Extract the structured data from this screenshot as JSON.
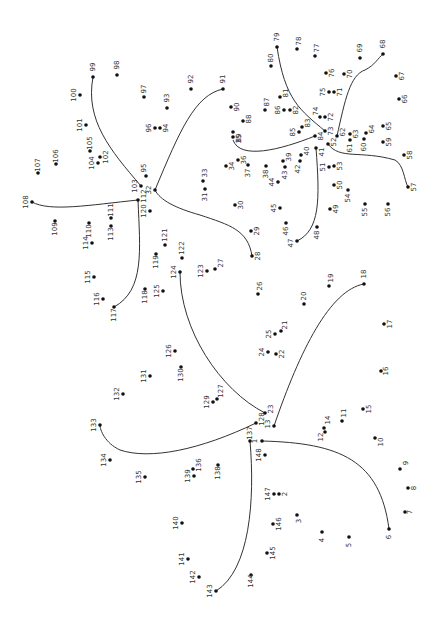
{
  "puzzle": {
    "title": "Dot-to-dot puzzle",
    "label_rotation_deg": -90,
    "dot_color": "#111111",
    "line_color": "#333333",
    "dots": [
      {
        "n": "1",
        "x": 262,
        "y": 441,
        "lx": -7,
        "ly": 0
      },
      {
        "n": "2",
        "x": 279,
        "y": 494,
        "lx": 6,
        "ly": 0
      },
      {
        "n": "3",
        "x": 297,
        "y": 515,
        "lx": 2,
        "ly": 6
      },
      {
        "n": "4",
        "x": 322,
        "y": 532,
        "lx": 0,
        "ly": 8
      },
      {
        "n": "5",
        "x": 349,
        "y": 537,
        "lx": 0,
        "ly": 8
      },
      {
        "n": "6",
        "x": 389,
        "y": 529,
        "lx": 0,
        "ly": 8
      },
      {
        "n": "7",
        "x": 405,
        "y": 512,
        "lx": 5,
        "ly": 0
      },
      {
        "n": "8",
        "x": 408,
        "y": 488,
        "lx": 6,
        "ly": 0
      },
      {
        "n": "9",
        "x": 400,
        "y": 469,
        "lx": 6,
        "ly": -6
      },
      {
        "n": "10",
        "x": 375,
        "y": 438,
        "lx": 6,
        "ly": 4
      },
      {
        "n": "11",
        "x": 342,
        "y": 421,
        "lx": 2,
        "ly": -8
      },
      {
        "n": "12",
        "x": 325,
        "y": 432,
        "lx": -4,
        "ly": 5
      },
      {
        "n": "13",
        "x": 274,
        "y": 426,
        "lx": -6,
        "ly": -2
      },
      {
        "n": "14",
        "x": 324,
        "y": 428,
        "lx": 4,
        "ly": -8
      },
      {
        "n": "15",
        "x": 363,
        "y": 409,
        "lx": 6,
        "ly": 0
      },
      {
        "n": "16",
        "x": 381,
        "y": 371,
        "lx": 5,
        "ly": 0
      },
      {
        "n": "17",
        "x": 384,
        "y": 324,
        "lx": 6,
        "ly": 0
      },
      {
        "n": "18",
        "x": 364,
        "y": 284,
        "lx": 0,
        "ly": -10
      },
      {
        "n": "19",
        "x": 329,
        "y": 286,
        "lx": 2,
        "ly": -8
      },
      {
        "n": "20",
        "x": 304,
        "y": 304,
        "lx": 0,
        "ly": -8
      },
      {
        "n": "21",
        "x": 281,
        "y": 331,
        "lx": 4,
        "ly": -6
      },
      {
        "n": "22",
        "x": 276,
        "y": 354,
        "lx": 6,
        "ly": 0
      },
      {
        "n": "23",
        "x": 265,
        "y": 413,
        "lx": 6,
        "ly": -4
      },
      {
        "n": "24",
        "x": 268,
        "y": 352,
        "lx": -6,
        "ly": 0
      },
      {
        "n": "25",
        "x": 275,
        "y": 334,
        "lx": -6,
        "ly": 0
      },
      {
        "n": "26",
        "x": 258,
        "y": 294,
        "lx": 2,
        "ly": -8
      },
      {
        "n": "27",
        "x": 215,
        "y": 269,
        "lx": 6,
        "ly": -6
      },
      {
        "n": "28",
        "x": 252,
        "y": 256,
        "lx": 6,
        "ly": 0
      },
      {
        "n": "29",
        "x": 251,
        "y": 231,
        "lx": 6,
        "ly": 0
      },
      {
        "n": "30",
        "x": 235,
        "y": 205,
        "lx": 6,
        "ly": 0
      },
      {
        "n": "31",
        "x": 205,
        "y": 189,
        "lx": 0,
        "ly": 8
      },
      {
        "n": "32",
        "x": 155,
        "y": 190,
        "lx": -6,
        "ly": 0
      },
      {
        "n": "33",
        "x": 203,
        "y": 181,
        "lx": 2,
        "ly": -8
      },
      {
        "n": "34",
        "x": 226,
        "y": 166,
        "lx": 6,
        "ly": 0
      },
      {
        "n": "35",
        "x": 233,
        "y": 137,
        "lx": 6,
        "ly": 2
      },
      {
        "n": "36",
        "x": 238,
        "y": 160,
        "lx": 6,
        "ly": 0
      },
      {
        "n": "37",
        "x": 248,
        "y": 165,
        "lx": 0,
        "ly": 8
      },
      {
        "n": "38",
        "x": 266,
        "y": 166,
        "lx": 0,
        "ly": 8
      },
      {
        "n": "39",
        "x": 283,
        "y": 161,
        "lx": 6,
        "ly": -4
      },
      {
        "n": "40",
        "x": 301,
        "y": 155,
        "lx": 6,
        "ly": -4
      },
      {
        "n": "41",
        "x": 316,
        "y": 148,
        "lx": 6,
        "ly": 4
      },
      {
        "n": "42",
        "x": 300,
        "y": 161,
        "lx": -2,
        "ly": 8
      },
      {
        "n": "43",
        "x": 285,
        "y": 167,
        "lx": 0,
        "ly": 8
      },
      {
        "n": "44",
        "x": 278,
        "y": 182,
        "lx": -6,
        "ly": 0
      },
      {
        "n": "45",
        "x": 280,
        "y": 208,
        "lx": -6,
        "ly": 0
      },
      {
        "n": "46",
        "x": 286,
        "y": 223,
        "lx": 0,
        "ly": 8
      },
      {
        "n": "47",
        "x": 297,
        "y": 241,
        "lx": -6,
        "ly": 2
      },
      {
        "n": "48",
        "x": 317,
        "y": 227,
        "lx": 0,
        "ly": 8
      },
      {
        "n": "49",
        "x": 330,
        "y": 209,
        "lx": 6,
        "ly": 0
      },
      {
        "n": "50",
        "x": 334,
        "y": 185,
        "lx": 6,
        "ly": 0
      },
      {
        "n": "51",
        "x": 329,
        "y": 167,
        "lx": -6,
        "ly": 0
      },
      {
        "n": "52",
        "x": 328,
        "y": 144,
        "lx": 6,
        "ly": -2
      },
      {
        "n": "53",
        "x": 334,
        "y": 166,
        "lx": 6,
        "ly": 0
      },
      {
        "n": "54",
        "x": 348,
        "y": 190,
        "lx": 0,
        "ly": 8
      },
      {
        "n": "55",
        "x": 365,
        "y": 204,
        "lx": 0,
        "ly": 8
      },
      {
        "n": "56",
        "x": 388,
        "y": 204,
        "lx": 0,
        "ly": 8
      },
      {
        "n": "57",
        "x": 408,
        "y": 187,
        "lx": 6,
        "ly": 0
      },
      {
        "n": "58",
        "x": 404,
        "y": 155,
        "lx": 6,
        "ly": 0
      },
      {
        "n": "59",
        "x": 383,
        "y": 142,
        "lx": 6,
        "ly": 0
      },
      {
        "n": "60",
        "x": 364,
        "y": 139,
        "lx": 0,
        "ly": 8
      },
      {
        "n": "61",
        "x": 350,
        "y": 140,
        "lx": 0,
        "ly": 8
      },
      {
        "n": "62",
        "x": 337,
        "y": 136,
        "lx": 6,
        "ly": -4
      },
      {
        "n": "63",
        "x": 350,
        "y": 134,
        "lx": 6,
        "ly": 0
      },
      {
        "n": "64",
        "x": 366,
        "y": 133,
        "lx": 6,
        "ly": -4
      },
      {
        "n": "65",
        "x": 383,
        "y": 126,
        "lx": 6,
        "ly": 0
      },
      {
        "n": "66",
        "x": 399,
        "y": 99,
        "lx": 6,
        "ly": 0
      },
      {
        "n": "67",
        "x": 396,
        "y": 76,
        "lx": 6,
        "ly": 0
      },
      {
        "n": "68",
        "x": 383,
        "y": 54,
        "lx": 0,
        "ly": -10
      },
      {
        "n": "69",
        "x": 360,
        "y": 58,
        "lx": 0,
        "ly": -10
      },
      {
        "n": "70",
        "x": 344,
        "y": 74,
        "lx": 6,
        "ly": 0
      },
      {
        "n": "71",
        "x": 334,
        "y": 92,
        "lx": 6,
        "ly": 0
      },
      {
        "n": "72",
        "x": 325,
        "y": 117,
        "lx": 6,
        "ly": 0
      },
      {
        "n": "73",
        "x": 325,
        "y": 131,
        "lx": 6,
        "ly": 0
      },
      {
        "n": "74",
        "x": 320,
        "y": 117,
        "lx": -4,
        "ly": -6
      },
      {
        "n": "75",
        "x": 329,
        "y": 92,
        "lx": -6,
        "ly": 0
      },
      {
        "n": "76",
        "x": 326,
        "y": 73,
        "lx": 6,
        "ly": 0
      },
      {
        "n": "77",
        "x": 315,
        "y": 56,
        "lx": 2,
        "ly": -8
      },
      {
        "n": "78",
        "x": 297,
        "y": 49,
        "lx": 2,
        "ly": -8
      },
      {
        "n": "79",
        "x": 277,
        "y": 47,
        "lx": 0,
        "ly": -10
      },
      {
        "n": "80",
        "x": 271,
        "y": 66,
        "lx": 0,
        "ly": -8
      },
      {
        "n": "81",
        "x": 280,
        "y": 97,
        "lx": 6,
        "ly": -4
      },
      {
        "n": "82",
        "x": 290,
        "y": 110,
        "lx": 6,
        "ly": 0
      },
      {
        "n": "83",
        "x": 302,
        "y": 127,
        "lx": 6,
        "ly": -4
      },
      {
        "n": "84",
        "x": 315,
        "y": 136,
        "lx": 6,
        "ly": 0
      },
      {
        "n": "85",
        "x": 299,
        "y": 132,
        "lx": -6,
        "ly": 0
      },
      {
        "n": "86",
        "x": 284,
        "y": 110,
        "lx": -6,
        "ly": 0
      },
      {
        "n": "87",
        "x": 265,
        "y": 110,
        "lx": 2,
        "ly": -8
      },
      {
        "n": "88",
        "x": 243,
        "y": 121,
        "lx": 6,
        "ly": -2
      },
      {
        "n": "89",
        "x": 233,
        "y": 132,
        "lx": 6,
        "ly": 6
      },
      {
        "n": "90",
        "x": 231,
        "y": 107,
        "lx": 6,
        "ly": 0
      },
      {
        "n": "91",
        "x": 223,
        "y": 89,
        "lx": 0,
        "ly": -10
      },
      {
        "n": "92",
        "x": 191,
        "y": 89,
        "lx": 0,
        "ly": -10
      },
      {
        "n": "93",
        "x": 167,
        "y": 108,
        "lx": 0,
        "ly": -10
      },
      {
        "n": "94",
        "x": 160,
        "y": 128,
        "lx": 6,
        "ly": 0
      },
      {
        "n": "95",
        "x": 146,
        "y": 176,
        "lx": -2,
        "ly": -8
      },
      {
        "n": "96",
        "x": 155,
        "y": 128,
        "lx": -6,
        "ly": 0
      },
      {
        "n": "97",
        "x": 144,
        "y": 97,
        "lx": 0,
        "ly": -8
      },
      {
        "n": "98",
        "x": 117,
        "y": 75,
        "lx": 0,
        "ly": -10
      },
      {
        "n": "99",
        "x": 93,
        "y": 77,
        "lx": 0,
        "ly": -10
      },
      {
        "n": "100",
        "x": 80,
        "y": 95,
        "lx": -6,
        "ly": 0
      },
      {
        "n": "101",
        "x": 86,
        "y": 125,
        "lx": -6,
        "ly": 0
      },
      {
        "n": "102",
        "x": 100,
        "y": 157,
        "lx": 6,
        "ly": 0
      },
      {
        "n": "103",
        "x": 141,
        "y": 186,
        "lx": -6,
        "ly": 0
      },
      {
        "n": "104",
        "x": 98,
        "y": 163,
        "lx": -6,
        "ly": 0
      },
      {
        "n": "105",
        "x": 90,
        "y": 151,
        "lx": 0,
        "ly": -8
      },
      {
        "n": "106",
        "x": 56,
        "y": 164,
        "lx": 0,
        "ly": -8
      },
      {
        "n": "107",
        "x": 38,
        "y": 173,
        "lx": 0,
        "ly": -8
      },
      {
        "n": "108",
        "x": 32,
        "y": 202,
        "lx": -6,
        "ly": 0
      },
      {
        "n": "109",
        "x": 55,
        "y": 221,
        "lx": 0,
        "ly": 8
      },
      {
        "n": "110",
        "x": 89,
        "y": 223,
        "lx": 0,
        "ly": 8
      },
      {
        "n": "111",
        "x": 111,
        "y": 218,
        "lx": 0,
        "ly": -8
      },
      {
        "n": "112",
        "x": 138,
        "y": 200,
        "lx": 6,
        "ly": -4
      },
      {
        "n": "113",
        "x": 111,
        "y": 226,
        "lx": 0,
        "ly": 8
      },
      {
        "n": "114",
        "x": 92,
        "y": 243,
        "lx": -6,
        "ly": 0
      },
      {
        "n": "115",
        "x": 94,
        "y": 277,
        "lx": -6,
        "ly": 0
      },
      {
        "n": "116",
        "x": 103,
        "y": 299,
        "lx": -6,
        "ly": 0
      },
      {
        "n": "117",
        "x": 114,
        "y": 307,
        "lx": 0,
        "ly": 8
      },
      {
        "n": "118",
        "x": 145,
        "y": 289,
        "lx": 0,
        "ly": 8
      },
      {
        "n": "119",
        "x": 156,
        "y": 254,
        "lx": 0,
        "ly": 8
      },
      {
        "n": "120",
        "x": 150,
        "y": 211,
        "lx": -6,
        "ly": 0
      },
      {
        "n": "121",
        "x": 165,
        "y": 245,
        "lx": 0,
        "ly": -10
      },
      {
        "n": "122",
        "x": 182,
        "y": 258,
        "lx": 0,
        "ly": -10
      },
      {
        "n": "123",
        "x": 207,
        "y": 271,
        "lx": -6,
        "ly": 0
      },
      {
        "n": "124",
        "x": 180,
        "y": 272,
        "lx": -6,
        "ly": 0
      },
      {
        "n": "125",
        "x": 163,
        "y": 291,
        "lx": -6,
        "ly": 0
      },
      {
        "n": "126",
        "x": 175,
        "y": 351,
        "lx": -6,
        "ly": 0
      },
      {
        "n": "127",
        "x": 217,
        "y": 399,
        "lx": 4,
        "ly": -8
      },
      {
        "n": "128",
        "x": 256,
        "y": 423,
        "lx": 6,
        "ly": -4
      },
      {
        "n": "129",
        "x": 213,
        "y": 402,
        "lx": -6,
        "ly": 0
      },
      {
        "n": "130",
        "x": 181,
        "y": 367,
        "lx": 0,
        "ly": 8
      },
      {
        "n": "131",
        "x": 150,
        "y": 376,
        "lx": -6,
        "ly": 0
      },
      {
        "n": "132",
        "x": 123,
        "y": 394,
        "lx": -6,
        "ly": 0
      },
      {
        "n": "133",
        "x": 100,
        "y": 425,
        "lx": -6,
        "ly": 0
      },
      {
        "n": "134",
        "x": 110,
        "y": 460,
        "lx": -6,
        "ly": 0
      },
      {
        "n": "135",
        "x": 145,
        "y": 477,
        "lx": -6,
        "ly": 0
      },
      {
        "n": "136",
        "x": 193,
        "y": 469,
        "lx": 6,
        "ly": -4
      },
      {
        "n": "137",
        "x": 250,
        "y": 441,
        "lx": 0,
        "ly": -8
      },
      {
        "n": "138",
        "x": 218,
        "y": 465,
        "lx": 0,
        "ly": 8
      },
      {
        "n": "139",
        "x": 194,
        "y": 476,
        "lx": -6,
        "ly": 0
      },
      {
        "n": "140",
        "x": 182,
        "y": 523,
        "lx": -6,
        "ly": 0
      },
      {
        "n": "141",
        "x": 188,
        "y": 559,
        "lx": -6,
        "ly": 0
      },
      {
        "n": "142",
        "x": 199,
        "y": 577,
        "lx": -6,
        "ly": 0
      },
      {
        "n": "143",
        "x": 216,
        "y": 591,
        "lx": -6,
        "ly": 0
      },
      {
        "n": "144",
        "x": 251,
        "y": 575,
        "lx": 0,
        "ly": 6
      },
      {
        "n": "145",
        "x": 267,
        "y": 553,
        "lx": 6,
        "ly": 0
      },
      {
        "n": "146",
        "x": 273,
        "y": 524,
        "lx": 6,
        "ly": 0
      },
      {
        "n": "147",
        "x": 274,
        "y": 494,
        "lx": -6,
        "ly": 0
      },
      {
        "n": "148",
        "x": 265,
        "y": 455,
        "lx": -6,
        "ly": 0
      }
    ],
    "curves": [
      {
        "id": "curve-1-6",
        "d": "M262 441 C 340 443, 380 460, 389 529"
      },
      {
        "id": "curve-13-18",
        "d": "M274 426 C 300 350, 330 290, 364 284"
      },
      {
        "id": "curve-23-124",
        "d": "M265 413 C 220 390, 180 330, 180 272"
      },
      {
        "id": "curve-28-32",
        "d": "M252 256 C 248 230, 230 225, 200 215 C 175 208, 160 200, 155 190"
      },
      {
        "id": "curve-32-91",
        "d": "M155 190 C 180 130, 195 95, 223 89"
      },
      {
        "id": "curve-89-84",
        "d": "M233 140 C 240 160, 280 150, 315 136"
      },
      {
        "id": "curve-41-47",
        "d": "M316 148 C 320 200, 320 230, 297 241"
      },
      {
        "id": "curve-52-57",
        "d": "M328 144 C 340 160, 360 150, 395 160 C 404 165, 404 180, 408 187"
      },
      {
        "id": "curve-62-68",
        "d": "M337 136 C 345 100, 350 75, 365 70 C 375 65, 378 58, 383 54"
      },
      {
        "id": "curve-73-79",
        "d": "M325 131 C 300 110, 285 100, 277 47"
      },
      {
        "id": "curve-99-103",
        "d": "M93 77 C 85 120, 110 150, 141 186"
      },
      {
        "id": "curve-108-112",
        "d": "M32 202 C 50 212, 90 205, 138 200"
      },
      {
        "id": "curve-112-117",
        "d": "M138 200 C 140 250, 145 290, 114 307"
      },
      {
        "id": "curve-128-133",
        "d": "M256 423 C 200 450, 150 460, 120 450 C 105 443, 100 430, 100 425"
      },
      {
        "id": "curve-137-143",
        "d": "M250 441 C 255 500, 250 570, 216 591"
      }
    ]
  }
}
